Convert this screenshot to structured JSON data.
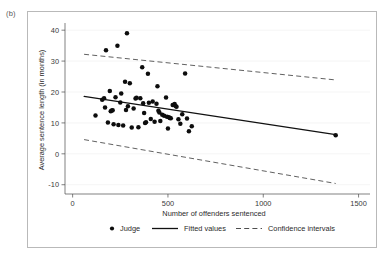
{
  "panel": {
    "label": "(b)"
  },
  "legend": {
    "position": "below-axis",
    "entries": [
      {
        "label": "Judge",
        "marker": "circle-marker",
        "color": "#0d0d0d"
      },
      {
        "label": "Fitted values",
        "marker": "solid-line",
        "color": "#111111"
      },
      {
        "label": "Confidence intervals",
        "marker": "dashed-line",
        "color": "#444444"
      }
    ]
  },
  "chart_data": {
    "type": "scatter",
    "title": "",
    "subtitle": "",
    "xlabel": "Number of offenders sentenced",
    "ylabel": "Average sentence length (in months)",
    "xlim": [
      -40,
      1560
    ],
    "ylim": [
      -13,
      42
    ],
    "xticks": [
      0,
      500,
      1000,
      1500
    ],
    "yticks": [
      -10,
      0,
      10,
      20,
      30,
      40
    ],
    "xtick_labels": [
      "0",
      "500",
      "1000",
      "1500"
    ],
    "ytick_labels": [
      "-10",
      "0",
      "10",
      "20",
      "30",
      "40"
    ],
    "grid": "horizontal-faint",
    "legend_position": "bottom",
    "series": [
      {
        "name": "Judge",
        "type": "scatter",
        "marker": "filled-circle",
        "color": "#0d0d0d",
        "points": [
          [
            120,
            12.4
          ],
          [
            155,
            17.5
          ],
          [
            165,
            18.0
          ],
          [
            170,
            15.0
          ],
          [
            175,
            33.5
          ],
          [
            185,
            10.1
          ],
          [
            195,
            20.3
          ],
          [
            200,
            13.8
          ],
          [
            205,
            14.0
          ],
          [
            210,
            14.1
          ],
          [
            215,
            9.6
          ],
          [
            225,
            18.3
          ],
          [
            235,
            35.0
          ],
          [
            240,
            9.3
          ],
          [
            250,
            16.6
          ],
          [
            255,
            19.5
          ],
          [
            265,
            9.2
          ],
          [
            275,
            23.3
          ],
          [
            280,
            14.2
          ],
          [
            285,
            39.0
          ],
          [
            290,
            15.4
          ],
          [
            300,
            22.8
          ],
          [
            310,
            8.5
          ],
          [
            320,
            14.7
          ],
          [
            330,
            17.9
          ],
          [
            335,
            18.1
          ],
          [
            345,
            8.6
          ],
          [
            355,
            18.0
          ],
          [
            365,
            28.0
          ],
          [
            370,
            16.4
          ],
          [
            375,
            13.2
          ],
          [
            380,
            10.0
          ],
          [
            385,
            10.2
          ],
          [
            395,
            25.9
          ],
          [
            400,
            16.5
          ],
          [
            410,
            11.3
          ],
          [
            420,
            16.9
          ],
          [
            430,
            10.4
          ],
          [
            440,
            16.2
          ],
          [
            445,
            21.9
          ],
          [
            450,
            13.9
          ],
          [
            455,
            13.4
          ],
          [
            460,
            10.6
          ],
          [
            470,
            12.6
          ],
          [
            480,
            12.3
          ],
          [
            490,
            18.2
          ],
          [
            495,
            12.0
          ],
          [
            500,
            8.2
          ],
          [
            505,
            11.8
          ],
          [
            510,
            11.6
          ],
          [
            515,
            11.5
          ],
          [
            525,
            15.8
          ],
          [
            535,
            16.1
          ],
          [
            540,
            15.5
          ],
          [
            545,
            15.2
          ],
          [
            555,
            11.2
          ],
          [
            565,
            9.7
          ],
          [
            575,
            12.8
          ],
          [
            590,
            26.0
          ],
          [
            600,
            11.4
          ],
          [
            610,
            7.3
          ],
          [
            625,
            8.9
          ],
          [
            1380,
            6.0
          ]
        ]
      },
      {
        "name": "Fitted values",
        "type": "line",
        "style": "solid",
        "color": "#111111",
        "points": [
          [
            60,
            18.6
          ],
          [
            1380,
            6.2
          ]
        ]
      },
      {
        "name": "Confidence intervals upper",
        "type": "line",
        "style": "dashed",
        "color": "#444444",
        "points": [
          [
            60,
            32.2
          ],
          [
            1380,
            23.9
          ]
        ]
      },
      {
        "name": "Confidence intervals lower",
        "type": "line",
        "style": "dashed",
        "color": "#444444",
        "points": [
          [
            60,
            4.6
          ],
          [
            1380,
            -9.6
          ]
        ]
      }
    ]
  }
}
